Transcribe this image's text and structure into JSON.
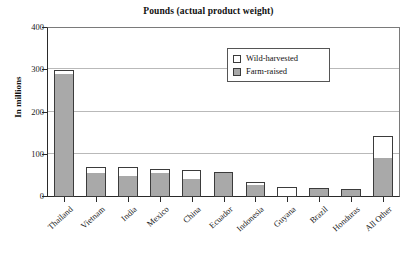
{
  "chart_data": {
    "type": "bar",
    "subtype": "stacked-vertical",
    "title": "Pounds (actual product weight)",
    "xlabel": "",
    "ylabel": "In millions",
    "ylim": [
      0,
      400
    ],
    "yticks": [
      0,
      100,
      200,
      300,
      400
    ],
    "ytick_labels": [
      "0",
      "100",
      "200",
      "300",
      "400"
    ],
    "grid": "horizontal",
    "legend_position": "inside-top-right",
    "categories": [
      "Thailand",
      "Vietnam",
      "India",
      "Mexico",
      "China",
      "Ecuador",
      "Indonesia",
      "Guyana",
      "Brazil",
      "Honduras",
      "All Other"
    ],
    "series": [
      {
        "name": "Farm-raised",
        "color": "#a9a9a9",
        "values": [
          290,
          57,
          50,
          57,
          43,
          59,
          29,
          0,
          21,
          19,
          93
        ]
      },
      {
        "name": "Wild-harvested",
        "color": "#ffffff",
        "values": [
          10,
          15,
          22,
          10,
          20,
          0,
          6,
          23,
          0,
          0,
          52
        ]
      }
    ],
    "totals": [
      300,
      72,
      72,
      67,
      63,
      59,
      35,
      23,
      21,
      19,
      145
    ]
  },
  "legend": {
    "items": [
      {
        "label": "Wild-harvested",
        "swatch": "wild"
      },
      {
        "label": "Farm-raised",
        "swatch": "farm"
      }
    ]
  },
  "colors": {
    "farm_raised": "#a9a9a9",
    "wild_harvested": "#ffffff",
    "bar_outline": "#3b3b3b",
    "axis": "#2a2a2a",
    "gridline": "#b9b9b9",
    "background": "#ffffff"
  }
}
